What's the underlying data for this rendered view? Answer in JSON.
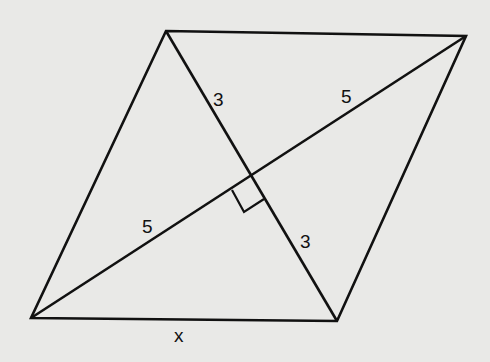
{
  "diagram": {
    "type": "rhombus-with-diagonals",
    "background": "#e9e9e7",
    "stroke": "#111111",
    "vertices": {
      "top_left": [
        166,
        31
      ],
      "top_right": [
        466,
        36
      ],
      "bottom_left": [
        31,
        318
      ],
      "bottom_right": [
        337,
        321
      ]
    },
    "labels": {
      "upper_short_half_diagonal": "3",
      "upper_long_half_diagonal": "5",
      "lower_long_half_diagonal": "5",
      "lower_short_half_diagonal": "3",
      "bottom_side": "x"
    },
    "right_angle_marker": true
  }
}
